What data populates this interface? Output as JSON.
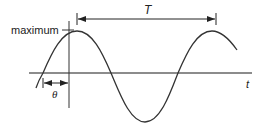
{
  "diagram": {
    "type": "sine-wave-phase-diagram",
    "labels": {
      "maximum": "maximum",
      "period": "T",
      "phase": "θ",
      "time_axis": "t"
    },
    "colors": {
      "line": "#222222",
      "axis": "#555555",
      "background": "#ffffff"
    },
    "elements": [
      "time axis (horizontal)",
      "reference vertical line at maximum",
      "sine curve",
      "period arrow T between successive maxima",
      "phase offset arrow θ"
    ]
  }
}
